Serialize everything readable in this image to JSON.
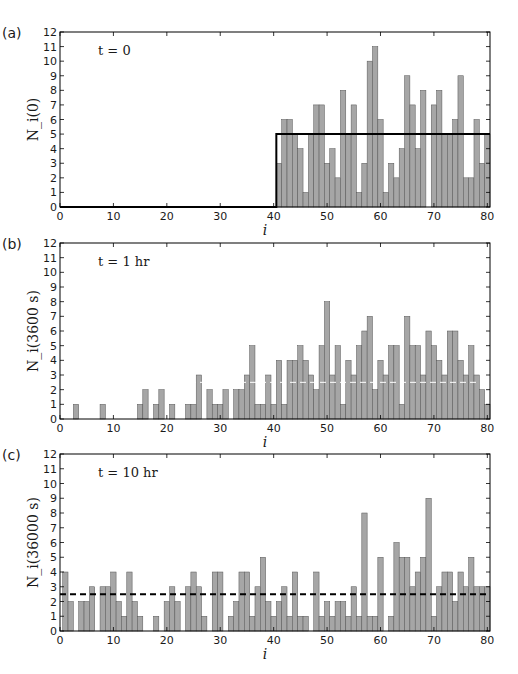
{
  "figure": {
    "width": 518,
    "height": 674,
    "bar_color": "#a6a6a6",
    "bar_edge": "#555555",
    "line_color": "#000000"
  },
  "chart_data": [
    {
      "type": "bar",
      "panel_label": "(a)",
      "annotation": "t = 0",
      "xlabel": "i",
      "ylabel": "N_i(0)",
      "xlim": [
        0,
        80.5
      ],
      "ylim": [
        0,
        12
      ],
      "xticks": [
        0,
        10,
        20,
        30,
        40,
        50,
        60,
        70,
        80
      ],
      "yticks": [
        0,
        1,
        2,
        3,
        4,
        5,
        6,
        7,
        8,
        9,
        10,
        11,
        12
      ],
      "grid": false,
      "x": [
        41,
        42,
        43,
        44,
        45,
        46,
        47,
        48,
        49,
        50,
        51,
        52,
        53,
        54,
        55,
        56,
        57,
        58,
        59,
        60,
        61,
        62,
        63,
        64,
        65,
        66,
        67,
        68,
        69,
        70,
        71,
        72,
        73,
        74,
        75,
        76,
        77,
        78,
        79,
        80
      ],
      "values": [
        3,
        6,
        6,
        5,
        4,
        1,
        5,
        7,
        7,
        3,
        4,
        2,
        8,
        5,
        7,
        1,
        3,
        10,
        11,
        6,
        1,
        3,
        2,
        4,
        9,
        7,
        4,
        8,
        0,
        7,
        8,
        5,
        5,
        6,
        9,
        2,
        2,
        6,
        3,
        5
      ],
      "overlay": {
        "type": "step",
        "style": "solid",
        "points": [
          [
            0,
            0
          ],
          [
            40.5,
            0
          ],
          [
            40.5,
            5
          ],
          [
            80.5,
            5
          ]
        ]
      }
    },
    {
      "type": "bar",
      "panel_label": "(b)",
      "annotation": "t = 1 hr",
      "xlabel": "i",
      "ylabel": "N_i(3600 s)",
      "xlim": [
        0,
        80.5
      ],
      "ylim": [
        0,
        12
      ],
      "xticks": [
        0,
        10,
        20,
        30,
        40,
        50,
        60,
        70,
        80
      ],
      "yticks": [
        0,
        1,
        2,
        3,
        4,
        5,
        6,
        7,
        8,
        9,
        10,
        11,
        12
      ],
      "grid": false,
      "x": [
        1,
        2,
        3,
        4,
        5,
        6,
        7,
        8,
        9,
        10,
        11,
        12,
        13,
        14,
        15,
        16,
        17,
        18,
        19,
        20,
        21,
        22,
        23,
        24,
        25,
        26,
        27,
        28,
        29,
        30,
        31,
        32,
        33,
        34,
        35,
        36,
        37,
        38,
        39,
        40,
        41,
        42,
        43,
        44,
        45,
        46,
        47,
        48,
        49,
        50,
        51,
        52,
        53,
        54,
        55,
        56,
        57,
        58,
        59,
        60,
        61,
        62,
        63,
        64,
        65,
        66,
        67,
        68,
        69,
        70,
        71,
        72,
        73,
        74,
        75,
        76,
        77,
        78,
        79,
        80
      ],
      "values": [
        0,
        0,
        1,
        0,
        0,
        0,
        0,
        1,
        0,
        0,
        0,
        0,
        0,
        0,
        1,
        2,
        0,
        1,
        2,
        0,
        1,
        0,
        0,
        1,
        1,
        3,
        0,
        2,
        1,
        1,
        2,
        0,
        2,
        2,
        3,
        5,
        1,
        1,
        3,
        1,
        4,
        1,
        4,
        4,
        5,
        4,
        3,
        2,
        5,
        8,
        3,
        5,
        1,
        4,
        3,
        5,
        6,
        7,
        2,
        4,
        3,
        5,
        5,
        1,
        7,
        5,
        5,
        3,
        6,
        5,
        4,
        3,
        6,
        6,
        4,
        3,
        5,
        3,
        2,
        1
      ],
      "overlay": {
        "type": "hline",
        "style": "dashed",
        "color": "#ffffff",
        "y": 2.5
      }
    },
    {
      "type": "bar",
      "panel_label": "(c)",
      "annotation": "t = 10 hr",
      "xlabel": "i",
      "ylabel": "N_i(36000 s)",
      "xlim": [
        0,
        80.5
      ],
      "ylim": [
        0,
        12
      ],
      "xticks": [
        0,
        10,
        20,
        30,
        40,
        50,
        60,
        70,
        80
      ],
      "yticks": [
        0,
        1,
        2,
        3,
        4,
        5,
        6,
        7,
        8,
        9,
        10,
        11,
        12
      ],
      "grid": false,
      "x": [
        1,
        2,
        3,
        4,
        5,
        6,
        7,
        8,
        9,
        10,
        11,
        12,
        13,
        14,
        15,
        16,
        17,
        18,
        19,
        20,
        21,
        22,
        23,
        24,
        25,
        26,
        27,
        28,
        29,
        30,
        31,
        32,
        33,
        34,
        35,
        36,
        37,
        38,
        39,
        40,
        41,
        42,
        43,
        44,
        45,
        46,
        47,
        48,
        49,
        50,
        51,
        52,
        53,
        54,
        55,
        56,
        57,
        58,
        59,
        60,
        61,
        62,
        63,
        64,
        65,
        66,
        67,
        68,
        69,
        70,
        71,
        72,
        73,
        74,
        75,
        76,
        77,
        78,
        79,
        80
      ],
      "values": [
        4,
        2,
        0,
        2,
        2,
        3,
        0,
        3,
        3,
        4,
        2,
        1,
        4,
        2,
        1,
        0,
        0,
        1,
        0,
        2,
        3,
        2,
        0,
        3,
        4,
        3,
        1,
        0,
        4,
        4,
        0,
        1,
        2,
        4,
        4,
        1,
        3,
        5,
        2,
        1,
        2,
        3,
        1,
        4,
        1,
        1,
        0,
        4,
        1,
        2,
        1,
        2,
        2,
        1,
        3,
        1,
        8,
        1,
        1,
        5,
        0,
        1,
        6,
        5,
        5,
        3,
        4,
        5,
        9,
        1,
        3,
        4,
        4,
        2,
        4,
        3,
        5,
        3,
        3,
        3
      ],
      "overlay": {
        "type": "hline",
        "style": "dashed",
        "color": "#000000",
        "y": 2.5
      }
    }
  ]
}
